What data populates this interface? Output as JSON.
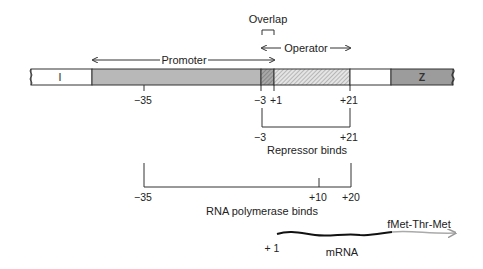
{
  "diagram": {
    "overlap_label": "Overlap",
    "operator_label": "Operator",
    "promoter_label": "Promoter",
    "genes": {
      "left": "I",
      "right": "Z"
    },
    "positions": {
      "minus35": "−35",
      "minus3": "−3",
      "plus1": "+1",
      "plus21": "+21"
    },
    "repressor": {
      "left": "−3",
      "right": "+21",
      "label": "Repressor binds"
    },
    "polymerase": {
      "left": "−35",
      "mid": "+10",
      "right": "+20",
      "label": "RNA polymerase binds"
    },
    "mrna": {
      "start": "+ 1",
      "label": "mRNA",
      "peptide": "fMet-Thr-Met"
    },
    "colors": {
      "promoter_fill": "#b8b8b8",
      "overlap_fill": "#9a9a9a",
      "z_fill": "#9c9c9c",
      "line": "#333333",
      "mrna_tail": "#aaaaaa"
    }
  }
}
